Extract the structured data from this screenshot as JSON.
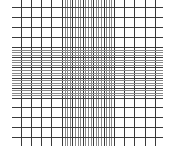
{
  "diagram": {
    "type": "neubauer-grid",
    "colors": {
      "background": "#ffffff",
      "major_line": "#3a3a3a",
      "minor_line": "#8a8a8a",
      "dense_line": "#555555"
    },
    "extent": {
      "x0": 12,
      "x1": 163,
      "y0": 0,
      "y1": 146
    },
    "verticals": {
      "outer_left": [
        21,
        31,
        41,
        51
      ],
      "outer_right": [
        124,
        134,
        145,
        155
      ],
      "center_band": {
        "start": 62,
        "end": 114,
        "count": 21
      }
    },
    "horizontals": {
      "outer_top": [
        7,
        17,
        27,
        37
      ],
      "outer_bottom": [
        107,
        117,
        127,
        137
      ],
      "center_band": {
        "start": 47,
        "end": 98,
        "count": 21
      }
    }
  }
}
